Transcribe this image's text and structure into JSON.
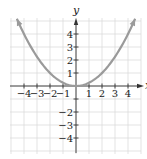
{
  "chart_data": {
    "type": "line",
    "title": "",
    "xlabel": "x",
    "ylabel": "y",
    "xlim": [
      -5,
      5
    ],
    "ylim": [
      -5.2,
      5.2
    ],
    "grid": true,
    "x_ticks": [
      -4,
      -3,
      -2,
      -1,
      1,
      2,
      3,
      4
    ],
    "y_ticks": [
      -4,
      -3,
      -2,
      -1,
      1,
      2,
      3,
      4
    ],
    "x_tick_labels": [
      "−4",
      "−3",
      "−2",
      "−1",
      "1",
      "2",
      "3",
      "4"
    ],
    "y_tick_labels": [
      "−4",
      "−3",
      "−2",
      "1",
      "2",
      "3",
      "4"
    ],
    "series": [
      {
        "name": "y = x²/4",
        "color": "#9a9a9a",
        "function": "x^2/4",
        "x_range": [
          -4.55,
          4.55
        ],
        "arrows": "both-ends",
        "points": [
          {
            "x": -4.55,
            "y": 5.18
          },
          {
            "x": -4,
            "y": 4
          },
          {
            "x": -3,
            "y": 2.25
          },
          {
            "x": -2,
            "y": 1
          },
          {
            "x": -1,
            "y": 0.25
          },
          {
            "x": 0,
            "y": 0
          },
          {
            "x": 1,
            "y": 0.25
          },
          {
            "x": 2,
            "y": 1
          },
          {
            "x": 3,
            "y": 2.25
          },
          {
            "x": 4,
            "y": 4
          },
          {
            "x": 4.55,
            "y": 5.18
          }
        ]
      }
    ],
    "colors": {
      "grid": "#dcdcdc",
      "axis": "#333333",
      "curve": "#9a9a9a",
      "text": "#222222"
    }
  }
}
